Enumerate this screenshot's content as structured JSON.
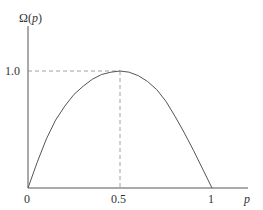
{
  "chart_data": {
    "type": "line",
    "title": "",
    "xlabel": "p",
    "ylabel": "Ω(p)",
    "xlim": [
      0,
      1.1
    ],
    "ylim": [
      0,
      1.5
    ],
    "grid": false,
    "legend": null,
    "x_ticks": [
      "0",
      "0.5",
      "1"
    ],
    "y_ticks": [
      "1.0"
    ],
    "series": [
      {
        "name": "Ω(p)",
        "x": [
          0,
          0.05,
          0.1,
          0.15,
          0.2,
          0.25,
          0.3,
          0.35,
          0.4,
          0.45,
          0.5,
          0.55,
          0.6,
          0.65,
          0.7,
          0.75,
          0.8,
          0.85,
          0.9,
          0.95,
          1.0
        ],
        "values": [
          0,
          0.22,
          0.42,
          0.58,
          0.7,
          0.8,
          0.87,
          0.93,
          0.97,
          0.99,
          1.0,
          0.99,
          0.96,
          0.91,
          0.84,
          0.74,
          0.61,
          0.47,
          0.32,
          0.16,
          0
        ]
      }
    ],
    "annotations": [
      {
        "type": "dashed-guide",
        "from": [
          0,
          1.0
        ],
        "to": [
          0.5,
          1.0
        ]
      },
      {
        "type": "dashed-guide",
        "from": [
          0.5,
          0
        ],
        "to": [
          0.5,
          1.0
        ]
      }
    ]
  },
  "labels": {
    "y_axis": "Ω(",
    "y_axis_var": "p",
    "y_axis_close": ")",
    "x_axis_var": "p",
    "tick_x0": "0",
    "tick_x05": "0.5",
    "tick_x1": "1",
    "tick_y1": "1.0"
  }
}
